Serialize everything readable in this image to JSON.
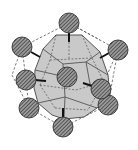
{
  "diagram": {
    "title": "",
    "colors": {
      "background": "#ffffff",
      "polyhedron_fill": "#c8c8c8",
      "polyhedron_edge": "#555555",
      "sphere_fill": "#8a8a8a",
      "sphere_hatch": "#2a2a2a",
      "sphere_outline": "#333333",
      "dashed_line": "#444444",
      "bond": "#111111"
    },
    "spheres": [
      {
        "id": "center",
        "x": 67,
        "y": 77,
        "r": 10
      },
      {
        "id": "top",
        "x": 69,
        "y": 23,
        "r": 10
      },
      {
        "id": "upper-left",
        "x": 22,
        "y": 47,
        "r": 10
      },
      {
        "id": "upper-right",
        "x": 118,
        "y": 50,
        "r": 10
      },
      {
        "id": "mid-left",
        "x": 26,
        "y": 80,
        "r": 10
      },
      {
        "id": "mid-right",
        "x": 101,
        "y": 89,
        "r": 10
      },
      {
        "id": "lower-left",
        "x": 29,
        "y": 108,
        "r": 10
      },
      {
        "id": "lower-right",
        "x": 108,
        "y": 105,
        "r": 10
      },
      {
        "id": "bottom",
        "x": 63,
        "y": 127,
        "r": 10
      }
    ]
  }
}
